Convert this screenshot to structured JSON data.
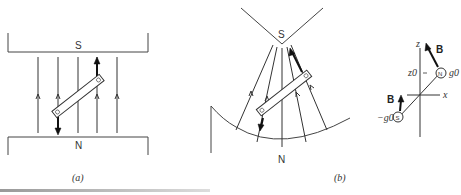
{
  "figure": {
    "panel_a": {
      "caption": "(a)",
      "top_pole": "S",
      "bottom_pole": "N",
      "description": "Uniform magnetic field between flat poles; bar magnet tilted, experiences torque only"
    },
    "panel_b": {
      "caption": "(b)",
      "top_pole": "S",
      "bottom_pole": "N",
      "description": "Non-uniform field between pointed S pole and concave N pole; bar magnet tilted"
    },
    "panel_c": {
      "axis_z": "z",
      "axis_x": "x",
      "z0_label": "z0",
      "field_label_top": "B",
      "field_label_bottom": "B",
      "pole_top": "N",
      "pole_bottom": "S",
      "charge_top": "g0",
      "charge_bottom": "−g0"
    }
  }
}
